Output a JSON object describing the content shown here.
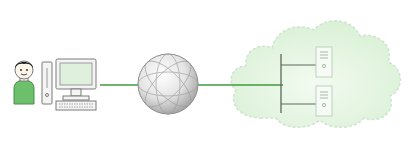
{
  "diagram": {
    "type": "network-topology",
    "nodes": [
      {
        "id": "user",
        "label": "",
        "icon": "person-icon"
      },
      {
        "id": "computer",
        "label": "",
        "icon": "desktop-computer-icon"
      },
      {
        "id": "internet",
        "label": "",
        "icon": "globe-icon"
      },
      {
        "id": "cloud",
        "label": "",
        "icon": "cloud-icon"
      },
      {
        "id": "server-1",
        "label": "",
        "icon": "server-icon"
      },
      {
        "id": "server-2",
        "label": "",
        "icon": "server-icon"
      }
    ],
    "edges": [
      {
        "from": "computer",
        "to": "internet"
      },
      {
        "from": "internet",
        "to": "cloud"
      },
      {
        "from": "cloud",
        "to": "server-1"
      },
      {
        "from": "cloud",
        "to": "server-2"
      }
    ],
    "colors": {
      "link": "#3f9a3f",
      "shirt": "#6cc06c",
      "cloud_fill": "#dff3df",
      "cloud_border": "#c8dcc8",
      "screen": "#dff0dc",
      "globe": "#d8d8d8",
      "outline": "#7a7a7a"
    }
  }
}
